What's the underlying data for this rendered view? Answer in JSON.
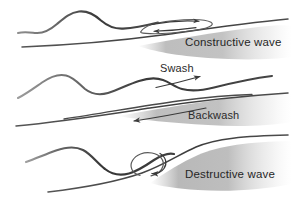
{
  "figure": {
    "background_color": "#ffffff",
    "ink_color": "#3a3a3a",
    "label_color": "#262626",
    "shore_shade_color": "#9a9a9a"
  },
  "panels": [
    {
      "id": "constructive",
      "label": "Constructive wave",
      "wave_crests": 1,
      "beach_slope": "gentle",
      "orbit": {
        "shape": "ellipse",
        "direction": "clockwise",
        "arrows": [
          {
            "name": "orbit-top-arrow",
            "points": "right"
          },
          {
            "name": "orbit-bottom-arrow",
            "points": "left"
          }
        ]
      }
    },
    {
      "id": "swash-backwash",
      "label": "",
      "wave_crests": 2,
      "beach_slope": "gentle",
      "flow_labels": [
        {
          "name": "swash",
          "text": "Swash",
          "arrow_direction": "right-up"
        },
        {
          "name": "backwash",
          "text": "Backwash",
          "arrow_direction": "left-down"
        }
      ]
    },
    {
      "id": "destructive",
      "label": "Destructive wave",
      "wave_crests": 1,
      "beach_slope": "steep",
      "orbit": {
        "shape": "circle",
        "direction": "clockwise",
        "arrows": [
          {
            "name": "plunge-arrow",
            "points": "down-left"
          }
        ]
      }
    }
  ],
  "labels": {
    "constructive_wave": "Constructive wave",
    "swash": "Swash",
    "backwash": "Backwash",
    "destructive_wave": "Destructive wave"
  }
}
